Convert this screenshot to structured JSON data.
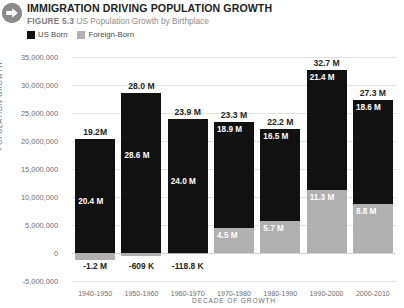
{
  "header": {
    "icon": "arrow-right-circle-icon",
    "title": "IMMIGRATION DRIVING POPULATION GROWTH",
    "figure_number": "FIGURE 5.3",
    "figure_caption": "US Population Growth by Birthplace"
  },
  "legend": {
    "position": "top-left",
    "items": [
      {
        "label": "US Born",
        "color": "#111111",
        "swatch": "us-born-swatch"
      },
      {
        "label": "Foreign-Born",
        "color": "#b0b0b0",
        "swatch": "foreign-born-swatch"
      }
    ]
  },
  "colors": {
    "us_born": "#111111",
    "foreign_born": "#b0b0b0",
    "gridline": "#e3e3e3",
    "text_dark": "#231f20",
    "text_muted": "#6e6e6e",
    "badge": "#8a8a8a"
  },
  "chart_data": {
    "type": "bar",
    "stacked": true,
    "title": "IMMIGRATION DRIVING POPULATION GROWTH",
    "subtitle": "US Population Growth by Birthplace",
    "xlabel": "DECADE OF GROWTH",
    "ylabel": "POPULATION GROWTH",
    "ylim": [
      -5000000,
      35000000
    ],
    "ytick_step": 5000000,
    "ytick_labels": [
      "35,000,000",
      "30,000,000",
      "25,000,000",
      "20,000,000",
      "15,000,000",
      "10,000,000",
      "5,000,000",
      "0",
      "-5,000,000"
    ],
    "ytick_values": [
      35000000,
      30000000,
      25000000,
      20000000,
      15000000,
      10000000,
      5000000,
      0,
      -5000000
    ],
    "grid": true,
    "legend": [
      "US Born",
      "Foreign-Born"
    ],
    "legend_position": "top-left",
    "categories": [
      "1940-1950",
      "1950-1960",
      "1960-1970",
      "1970-1980",
      "1980-1990",
      "1990-2000",
      "2000-2010"
    ],
    "series": [
      {
        "name": "US Born",
        "values": [
          20400000,
          28600000,
          24000000,
          18900000,
          16500000,
          21400000,
          18600000
        ],
        "labels": [
          "20.4 M",
          "28.6 M",
          "24.0 M",
          "18.9 M",
          "16.5 M",
          "21.4 M",
          "18.6 M"
        ]
      },
      {
        "name": "Foreign-Born",
        "values": [
          -1200000,
          -609000,
          -118800,
          4500000,
          5700000,
          11300000,
          8800000
        ],
        "labels": [
          "-1.2 M",
          "-609 K",
          "-118.8 K",
          "4.5 M",
          "5.7 M",
          "11.3 M",
          "8.8 M"
        ]
      }
    ],
    "totals": {
      "values": [
        19200000,
        28000000,
        23900000,
        23300000,
        22200000,
        32700000,
        27300000
      ],
      "labels": [
        "19.2M",
        "28.0 M",
        "23.9 M",
        "23.3 M",
        "22.2 M",
        "32.7 M",
        "27.3 M"
      ]
    }
  }
}
